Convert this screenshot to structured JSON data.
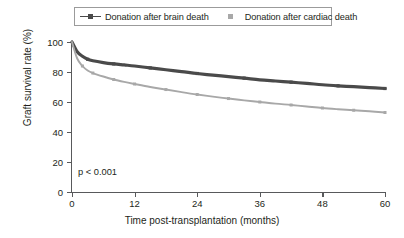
{
  "chart_data": {
    "type": "line",
    "title": "",
    "xlabel": "Time post-transplantation (months)",
    "ylabel": "Graft survival rate (%)",
    "xlim": [
      0,
      60
    ],
    "ylim": [
      0,
      100
    ],
    "xticks": [
      0,
      12,
      24,
      36,
      48,
      60
    ],
    "yticks": [
      0,
      20,
      40,
      60,
      80,
      100
    ],
    "grid": false,
    "legend_position": "top-center",
    "annotations": [
      {
        "text": "p < 0.001",
        "x": 2,
        "y": 17
      }
    ],
    "series": [
      {
        "name": "Donation after brain death",
        "color": "#4a4a4a",
        "marker": "square",
        "x": [
          0,
          1,
          2,
          3,
          4,
          6,
          8,
          10,
          12,
          15,
          18,
          21,
          24,
          27,
          30,
          33,
          36,
          39,
          42,
          45,
          48,
          51,
          54,
          57,
          60
        ],
        "values": [
          100,
          93.5,
          90.5,
          88.5,
          87.5,
          86.3,
          85.4,
          84.7,
          84.0,
          82.7,
          81.5,
          80.3,
          79.0,
          77.9,
          76.9,
          75.9,
          74.8,
          74.0,
          73.2,
          72.4,
          71.5,
          70.8,
          70.2,
          69.6,
          69.0
        ]
      },
      {
        "name": "Donation after cardiac death",
        "color": "#a8a8a8",
        "marker": "square",
        "x": [
          0,
          1,
          2,
          3,
          4,
          6,
          8,
          10,
          12,
          15,
          18,
          21,
          24,
          27,
          30,
          33,
          36,
          39,
          42,
          45,
          48,
          51,
          54,
          57,
          60
        ],
        "values": [
          100,
          89.0,
          84.0,
          81.0,
          79.3,
          77.0,
          75.0,
          73.4,
          72.0,
          70.0,
          68.3,
          66.6,
          65.0,
          63.6,
          62.3,
          61.1,
          60.0,
          58.9,
          58.0,
          57.0,
          56.0,
          55.2,
          54.5,
          53.8,
          53.0
        ]
      }
    ]
  },
  "axis": {
    "y_title": "Graft survival rate (%)",
    "x_title": "Time post-transplantation (months)",
    "y_tick_labels": [
      "0",
      "20",
      "40",
      "60",
      "80",
      "100"
    ],
    "x_tick_labels": [
      "0",
      "12",
      "24",
      "36",
      "48",
      "60"
    ]
  },
  "legend": {
    "entries": [
      {
        "label": "Donation after brain death",
        "color": "#4a4a4a",
        "has_line": true
      },
      {
        "label": "Donation after cardiac death",
        "color": "#a8a8a8",
        "has_line": false
      }
    ]
  },
  "annotation": {
    "p_value": "p < 0.001"
  }
}
